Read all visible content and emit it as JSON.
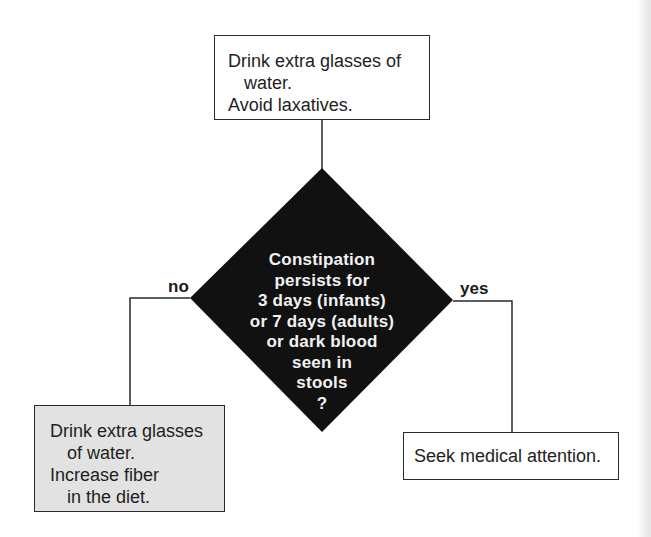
{
  "flowchart": {
    "top_box": {
      "lines": [
        "Drink extra glasses of",
        "water.",
        "Avoid laxatives."
      ]
    },
    "decision": {
      "lines": [
        "Constipation",
        "persists  for",
        "3  days  (infants)",
        "or 7 days (adults)",
        "or dark blood",
        "seen  in",
        "stools",
        "?"
      ],
      "fill_color": "#111111"
    },
    "branches": {
      "no_label": "no",
      "yes_label": "yes"
    },
    "left_box": {
      "lines": [
        "Drink extra glasses",
        "of water.",
        "Increase fiber",
        "in the diet."
      ],
      "fill_color": "#e2e2e2"
    },
    "right_box": {
      "lines": [
        "Seek medical attention."
      ]
    }
  }
}
